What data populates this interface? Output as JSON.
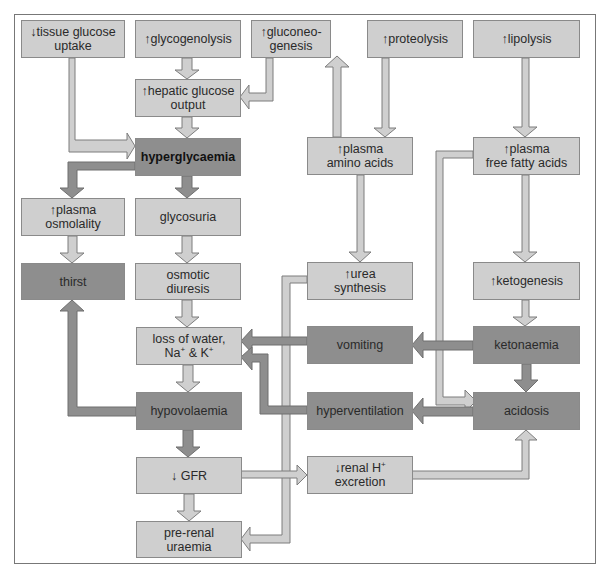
{
  "diagram": {
    "title": "",
    "colors": {
      "light_box": "#cfcfcf",
      "dark_box": "#8e8e8e",
      "light_arrow": "#cfcfcf",
      "dark_arrow": "#8e8e8e",
      "outline": "#8a8a8a"
    },
    "nodes": {
      "tissue_glucose_uptake": {
        "line1": "↓tissue glucose",
        "line2": "uptake",
        "style": "light"
      },
      "glycogenolysis": {
        "line1": "↑glycogenolysis",
        "line2": "",
        "style": "light"
      },
      "gluconeogenesis": {
        "line1": "↑gluconeo-",
        "line2": "genesis",
        "style": "light"
      },
      "proteolysis": {
        "line1": "↑proteolysis",
        "line2": "",
        "style": "light"
      },
      "lipolysis": {
        "line1": "↑lipolysis",
        "line2": "",
        "style": "light"
      },
      "hepatic_glucose_output": {
        "line1": "↑hepatic glucose",
        "line2": "output",
        "style": "light"
      },
      "hyperglycaemia": {
        "line1": "hyperglycaemia",
        "line2": "",
        "style": "dark-bold"
      },
      "plasma_amino_acids": {
        "line1": "↑plasma",
        "line2": "amino acids",
        "style": "light"
      },
      "plasma_free_fatty_acids": {
        "line1": "↑plasma",
        "line2": "free fatty acids",
        "style": "light"
      },
      "plasma_osmolality": {
        "line1": "↑plasma",
        "line2": "osmolality",
        "style": "light"
      },
      "glycosuria": {
        "line1": "glycosuria",
        "line2": "",
        "style": "light"
      },
      "thirst": {
        "line1": "thirst",
        "line2": "",
        "style": "dark"
      },
      "osmotic_diuresis": {
        "line1": "osmotic",
        "line2": "diuresis",
        "style": "light"
      },
      "urea_synthesis": {
        "line1": "↑urea",
        "line2": "synthesis",
        "style": "light"
      },
      "ketogenesis": {
        "line1": "↑ketogenesis",
        "line2": "",
        "style": "light"
      },
      "loss_of_water": {
        "line1": "loss of water,",
        "line2_a": "Na",
        "line2_sup1": "+",
        "line2_b": " & K",
        "line2_sup2": "+",
        "style": "light"
      },
      "vomiting": {
        "line1": "vomiting",
        "line2": "",
        "style": "dark"
      },
      "ketonaemia": {
        "line1": "ketonaemia",
        "line2": "",
        "style": "dark"
      },
      "hypovolaemia": {
        "line1": "hypovolaemia",
        "line2": "",
        "style": "dark"
      },
      "hyperventilation": {
        "line1": "hyperventilation",
        "line2": "",
        "style": "dark"
      },
      "acidosis": {
        "line1": "acidosis",
        "line2": "",
        "style": "dark"
      },
      "gfr": {
        "line1": "↓ GFR",
        "line2": "",
        "style": "light"
      },
      "renal_h_excretion": {
        "line1_a": "↓renal H",
        "line1_sup": "+",
        "line2": "excretion",
        "style": "light"
      },
      "pre_renal_uraemia": {
        "line1": "pre-renal",
        "line2": "uraemia",
        "style": "light"
      }
    },
    "edges": [
      {
        "from": "tissue_glucose_uptake",
        "to": "hyperglycaemia",
        "style": "light"
      },
      {
        "from": "glycogenolysis",
        "to": "hepatic_glucose_output",
        "style": "light"
      },
      {
        "from": "gluconeogenesis",
        "to": "hepatic_glucose_output",
        "style": "light"
      },
      {
        "from": "hepatic_glucose_output",
        "to": "hyperglycaemia",
        "style": "light"
      },
      {
        "from": "plasma_amino_acids",
        "to": "gluconeogenesis",
        "style": "light"
      },
      {
        "from": "proteolysis",
        "to": "plasma_amino_acids",
        "style": "light"
      },
      {
        "from": "lipolysis",
        "to": "plasma_free_fatty_acids",
        "style": "light"
      },
      {
        "from": "hyperglycaemia",
        "to": "plasma_osmolality",
        "style": "dark"
      },
      {
        "from": "hyperglycaemia",
        "to": "glycosuria",
        "style": "dark"
      },
      {
        "from": "plasma_osmolality",
        "to": "thirst",
        "style": "light"
      },
      {
        "from": "glycosuria",
        "to": "osmotic_diuresis",
        "style": "light"
      },
      {
        "from": "osmotic_diuresis",
        "to": "loss_of_water",
        "style": "light"
      },
      {
        "from": "plasma_amino_acids",
        "to": "urea_synthesis",
        "style": "light"
      },
      {
        "from": "urea_synthesis",
        "to": "pre_renal_uraemia",
        "style": "light"
      },
      {
        "from": "plasma_free_fatty_acids",
        "to": "ketogenesis",
        "style": "light"
      },
      {
        "from": "plasma_free_fatty_acids",
        "to": "acidosis",
        "style": "light"
      },
      {
        "from": "ketogenesis",
        "to": "ketonaemia",
        "style": "light"
      },
      {
        "from": "ketonaemia",
        "to": "vomiting",
        "style": "dark"
      },
      {
        "from": "ketonaemia",
        "to": "acidosis",
        "style": "dark"
      },
      {
        "from": "vomiting",
        "to": "loss_of_water",
        "style": "dark"
      },
      {
        "from": "hyperventilation",
        "to": "loss_of_water",
        "style": "dark"
      },
      {
        "from": "acidosis",
        "to": "hyperventilation",
        "style": "dark"
      },
      {
        "from": "loss_of_water",
        "to": "hypovolaemia",
        "style": "light"
      },
      {
        "from": "hypovolaemia",
        "to": "thirst",
        "style": "dark"
      },
      {
        "from": "hypovolaemia",
        "to": "gfr",
        "style": "dark"
      },
      {
        "from": "gfr",
        "to": "pre_renal_uraemia",
        "style": "light"
      },
      {
        "from": "gfr",
        "to": "renal_h_excretion",
        "style": "light"
      },
      {
        "from": "renal_h_excretion",
        "to": "acidosis",
        "style": "light"
      }
    ]
  }
}
